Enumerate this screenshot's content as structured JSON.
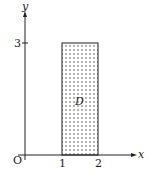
{
  "diagram": {
    "axes": {
      "x_label": "x",
      "y_label": "y",
      "origin_label": "O"
    },
    "ticks": {
      "x": [
        "1",
        "2"
      ],
      "y": [
        "3"
      ]
    },
    "region": {
      "label": "D",
      "x_range": [
        1,
        2
      ],
      "y_range": [
        0,
        3
      ],
      "fill": "dotted"
    },
    "colors": {
      "line": "#222222",
      "dots": "#333333",
      "background": "#ffffff"
    }
  }
}
